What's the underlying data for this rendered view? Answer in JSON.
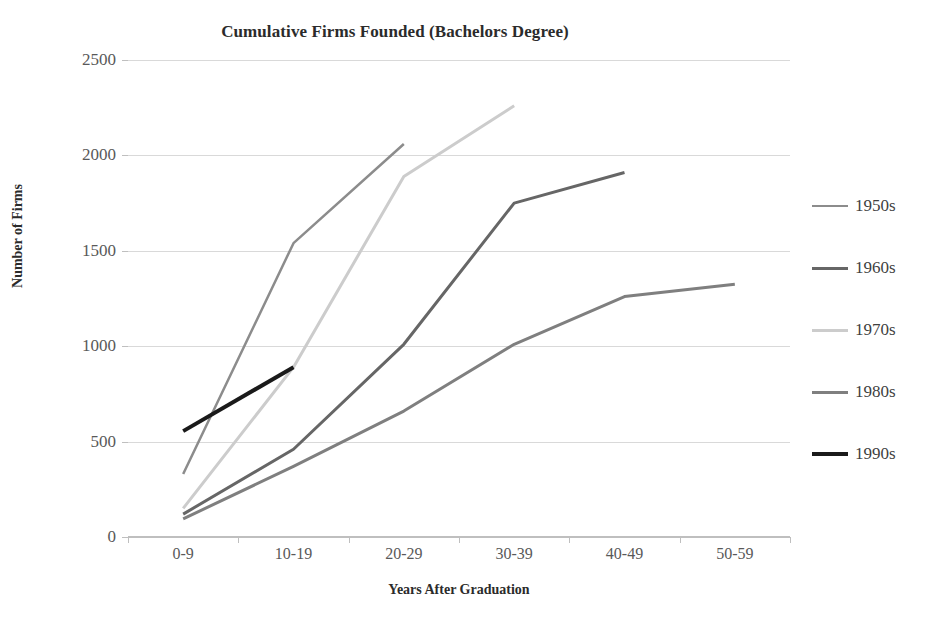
{
  "chart_data": {
    "type": "line",
    "title": "Cumulative Firms Founded (Bachelors Degree)",
    "xlabel": "Years After Graduation",
    "ylabel": "Number of Firms",
    "categories": [
      "0-9",
      "10-19",
      "20-29",
      "30-39",
      "40-49",
      "50-59"
    ],
    "yticks": [
      0,
      500,
      1000,
      1500,
      2000,
      2500
    ],
    "ylim": [
      0,
      2500
    ],
    "grid": true,
    "legend_position": "right",
    "series": [
      {
        "name": "1950s",
        "color": "#8c8c8c",
        "width": 2.5,
        "values": [
          330,
          1540,
          2060,
          null,
          null,
          null
        ]
      },
      {
        "name": "1960s",
        "color": "#666666",
        "width": 3,
        "values": [
          120,
          460,
          1010,
          1750,
          1910,
          null
        ]
      },
      {
        "name": "1970s",
        "color": "#cccccc",
        "width": 3,
        "values": [
          150,
          890,
          1890,
          2260,
          null,
          null
        ]
      },
      {
        "name": "1980s",
        "color": "#7f7f7f",
        "width": 3,
        "values": [
          95,
          370,
          660,
          1010,
          1260,
          1325
        ]
      },
      {
        "name": "1990s",
        "color": "#1a1a1a",
        "width": 4,
        "values": [
          555,
          890,
          null,
          null,
          null,
          null
        ]
      }
    ]
  },
  "legend": {
    "items": [
      {
        "label": "1950s",
        "color": "#8c8c8c",
        "width": 2.5
      },
      {
        "label": "1960s",
        "color": "#666666",
        "width": 3
      },
      {
        "label": "1970s",
        "color": "#cccccc",
        "width": 3
      },
      {
        "label": "1980s",
        "color": "#7f7f7f",
        "width": 3
      },
      {
        "label": "1990s",
        "color": "#1a1a1a",
        "width": 4
      }
    ]
  }
}
